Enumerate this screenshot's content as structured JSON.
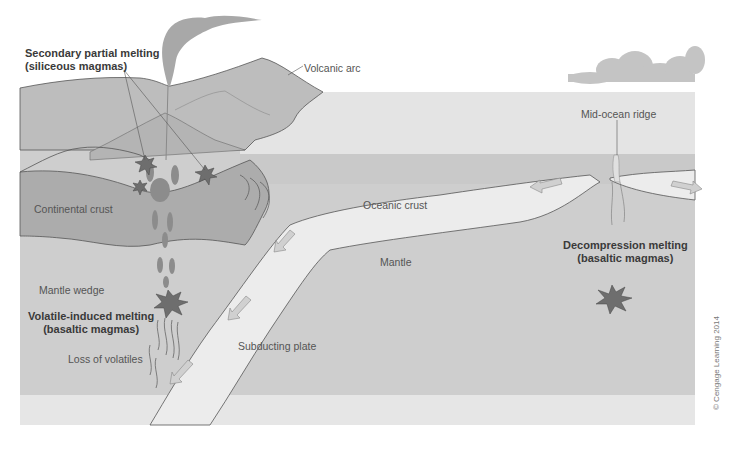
{
  "diagram": {
    "labels": {
      "secondary_melting_line1": "Secondary partial melting",
      "secondary_melting_line2": "(siliceous magmas)",
      "volcanic_arc": "Volcanic arc",
      "mid_ocean_ridge": "Mid-ocean ridge",
      "continental_crust": "Continental crust",
      "oceanic_crust": "Oceanic crust",
      "mantle": "Mantle",
      "mantle_wedge": "Mantle wedge",
      "volatile_melting_line1": "Volatile-induced melting",
      "volatile_melting_line2": "(basaltic magmas)",
      "decompression_melting_line1": "Decompression melting",
      "decompression_melting_line2": "(basaltic magmas)",
      "loss_of_volatiles": "Loss of volatiles",
      "subducting_plate": "Subducting plate"
    },
    "copyright": "© Cengage Learning 2014",
    "colors": {
      "sky": "#ffffff",
      "ocean_surface": "#e4e4e4",
      "ocean_deep": "#c9c9c9",
      "land": "#bdbdbd",
      "continental_crust": "#acacac",
      "oceanic_crust": "#ececec",
      "mantle": "#cecece",
      "magma": "#7d7d7d",
      "arrow": "#c8c8c8",
      "outline": "#555555",
      "text": "#555555",
      "bold_text": "#3a3a3a"
    }
  }
}
